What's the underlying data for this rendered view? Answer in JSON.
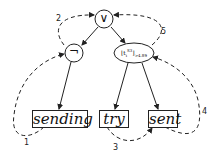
{
  "diagram": {
    "nodes": {
      "or": {
        "symbol": "∨",
        "shape": "circle"
      },
      "not": {
        "symbol": "¬",
        "shape": "circle"
      },
      "threshold": {
        "label": "⌊t",
        "sub": "i",
        "sup": "S3",
        "close": "⌋",
        "cond": ">4.89",
        "shape": "ellipse"
      },
      "sending": {
        "label": "sending",
        "shape": "box"
      },
      "try": {
        "label": "try",
        "shape": "box"
      },
      "sent": {
        "label": "sent",
        "shape": "box"
      }
    },
    "edges": [
      {
        "from": "or",
        "to": "not",
        "style": "solid"
      },
      {
        "from": "or",
        "to": "threshold",
        "style": "solid"
      },
      {
        "from": "not",
        "to": "sending",
        "style": "solid"
      },
      {
        "from": "threshold",
        "to": "try",
        "style": "solid"
      },
      {
        "from": "threshold",
        "to": "sent",
        "style": "solid"
      }
    ],
    "traversal_steps": [
      {
        "label": "1",
        "from": "sending",
        "to": "not"
      },
      {
        "label": "2",
        "from": "not",
        "to": "or"
      },
      {
        "label": "3",
        "from": "try",
        "to": "sent"
      },
      {
        "label": "4",
        "from": "sent",
        "to": "threshold"
      },
      {
        "label": "5",
        "from": "threshold",
        "to": "or"
      }
    ]
  }
}
